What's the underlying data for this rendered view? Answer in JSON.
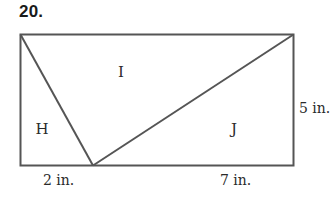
{
  "problem": {
    "number": "20."
  },
  "figure": {
    "shape": "rectangle divided into three triangles",
    "stroke_color": "#555555",
    "rectangle": {
      "width_in": 9,
      "height_in": 5
    },
    "regions": [
      {
        "id": "H",
        "label": "H"
      },
      {
        "id": "I",
        "label": "I"
      },
      {
        "id": "J",
        "label": "J"
      }
    ],
    "dimensions": {
      "height": "5 in.",
      "bottom_left_segment": "2 in.",
      "bottom_right_segment": "7 in."
    }
  }
}
